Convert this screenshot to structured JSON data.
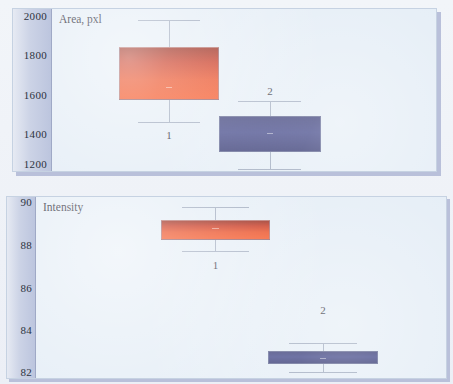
{
  "figure": {
    "background_color": "#eef2f7",
    "panel_face_color": "#e4edf6",
    "axis_strip_color": "#bcc5de"
  },
  "chart_data": [
    {
      "type": "box",
      "title": "",
      "ylabel": "Area, pxl",
      "xlabel": "",
      "ylim": [
        1130,
        2010
      ],
      "yticks": [
        2000,
        1800,
        1600,
        1400,
        1200
      ],
      "ytick_labels": [
        "2000",
        "1800",
        "1600",
        "1400",
        "1200"
      ],
      "grid": false,
      "legend": "none",
      "categories": [
        "1",
        "2"
      ],
      "boxes": [
        {
          "label": "1",
          "color": "#e83a0c",
          "color_name": "red",
          "whisker_high": 1947,
          "q3": 1848,
          "median": 1720,
          "q1": 1583,
          "whisker_low": 1443
        },
        {
          "label": "2",
          "color": "#343a80",
          "color_name": "blue",
          "whisker_high": 1572,
          "q3": 1488,
          "median": 1397,
          "q1": 1305,
          "whisker_low": 1207
        }
      ]
    },
    {
      "type": "box",
      "title": "",
      "ylabel": "Intensity",
      "xlabel": "",
      "ylim": [
        81.6,
        90.2
      ],
      "yticks": [
        90,
        88,
        86,
        84,
        82
      ],
      "ytick_labels": [
        "90",
        "88",
        "86",
        "84",
        "82"
      ],
      "grid": false,
      "legend": "none",
      "categories": [
        "1",
        "2"
      ],
      "boxes": [
        {
          "label": "1",
          "color": "#e83a0c",
          "color_name": "red",
          "whisker_high": 89.78,
          "q3": 89.42,
          "median": 89.15,
          "q1": 88.85,
          "whisker_low": 88.52
        },
        {
          "label": "2",
          "color": "#343a80",
          "color_name": "blue",
          "whisker_high": 83.1,
          "q3": 82.9,
          "median": 82.76,
          "q1": 82.6,
          "whisker_low": 82.4
        }
      ]
    }
  ],
  "panels": {
    "area": {
      "axis_title": "Area, pxl",
      "ticks": [
        {
          "label": "2000",
          "top_pct": 4.2
        },
        {
          "label": "1800",
          "top_pct": 28.6
        },
        {
          "label": "1600",
          "top_pct": 53.0
        },
        {
          "label": "1400",
          "top_pct": 77.4
        },
        {
          "label": "1200",
          "top_pct": 95.5
        }
      ],
      "series": [
        {
          "label": "1",
          "color_name": "red",
          "left_pct": 17.5,
          "width_pct": 26.0,
          "cap_high_pct": 6.5,
          "box_top_pct": 23.5,
          "median_pct": 48.0,
          "box_bottom_pct": 56.0,
          "cap_low_pct": 70.0,
          "label_top_pct": 74.0
        },
        {
          "label": "2",
          "color_name": "blue",
          "left_pct": 43.5,
          "width_pct": 26.5,
          "cap_high_pct": 56.5,
          "box_top_pct": 66.0,
          "median_pct": 76.5,
          "box_bottom_pct": 88.0,
          "cap_low_pct": 99.0,
          "label_top_pct": 47.0
        }
      ]
    },
    "intensity": {
      "axis_title": "Intensity",
      "ticks": [
        {
          "label": "90",
          "top_pct": 3.0
        },
        {
          "label": "88",
          "top_pct": 26.5
        },
        {
          "label": "86",
          "top_pct": 50.0
        },
        {
          "label": "84",
          "top_pct": 73.5
        },
        {
          "label": "82",
          "top_pct": 96.5
        }
      ],
      "series": [
        {
          "label": "1",
          "color_name": "red",
          "left_pct": 30.5,
          "width_pct": 26.5,
          "cap_high_pct": 5.5,
          "box_top_pct": 12.5,
          "median_pct": 17.0,
          "box_bottom_pct": 23.5,
          "cap_low_pct": 30.0,
          "label_top_pct": 34.0
        },
        {
          "label": "2",
          "color_name": "blue",
          "left_pct": 56.5,
          "width_pct": 27.0,
          "cap_high_pct": 80.5,
          "box_top_pct": 85.0,
          "median_pct": 89.0,
          "box_bottom_pct": 92.5,
          "cap_low_pct": 96.5,
          "label_top_pct": 59.0
        }
      ]
    }
  }
}
